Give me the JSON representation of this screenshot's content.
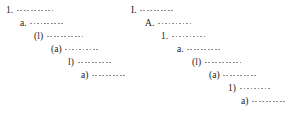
{
  "figure": {
    "name": "outline-numbering-styles",
    "background_color": "#ffffff",
    "text_color": "#1a1a1a",
    "leader_color": "#8d8d8d"
  },
  "columns": [
    {
      "id": "left",
      "name": "arabic-outline",
      "levels": [
        {
          "marker": "1.",
          "indent_px": 6,
          "leader_px": 36,
          "top_px": 6
        },
        {
          "marker": "a.",
          "indent_px": 20,
          "leader_px": 33,
          "top_px": 19
        },
        {
          "marker": "(l)",
          "indent_px": 34,
          "leader_px": 36,
          "top_px": 32
        },
        {
          "marker": "(a)",
          "indent_px": 51,
          "leader_px": 35,
          "top_px": 45
        },
        {
          "marker": "l)",
          "indent_px": 68,
          "leader_px": 33,
          "top_px": 58
        },
        {
          "marker": "a)",
          "indent_px": 81,
          "leader_px": 35,
          "top_px": 71
        }
      ]
    },
    {
      "id": "right",
      "name": "roman-outline",
      "levels": [
        {
          "marker": "I.",
          "indent_px": 3,
          "leader_px": 33,
          "top_px": 6
        },
        {
          "marker": "A.",
          "indent_px": 17,
          "leader_px": 34,
          "top_px": 19
        },
        {
          "marker": "1.",
          "indent_px": 33,
          "leader_px": 35,
          "top_px": 32
        },
        {
          "marker": "a.",
          "indent_px": 49,
          "leader_px": 33,
          "top_px": 45
        },
        {
          "marker": "(l)",
          "indent_px": 64,
          "leader_px": 36,
          "top_px": 58
        },
        {
          "marker": "(a)",
          "indent_px": 81,
          "leader_px": 33,
          "top_px": 71
        },
        {
          "marker": "1)",
          "indent_px": 100,
          "leader_px": 32,
          "top_px": 84
        },
        {
          "marker": "a)",
          "indent_px": 113,
          "leader_px": 35,
          "top_px": 97
        }
      ]
    }
  ]
}
